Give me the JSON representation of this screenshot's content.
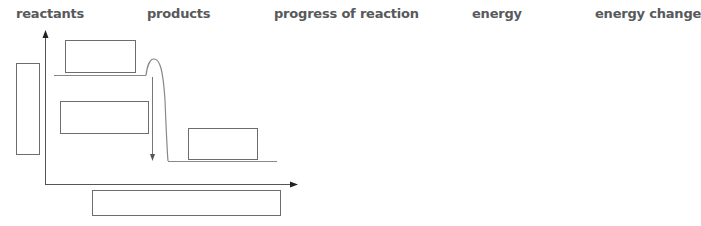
{
  "word_bank": [
    {
      "id": "reactants",
      "label": "reactants",
      "x": 16
    },
    {
      "id": "products",
      "label": "products",
      "x": 147
    },
    {
      "id": "progress-of-reaction",
      "label": "progress of reaction",
      "x": 274
    },
    {
      "id": "energy",
      "label": "energy",
      "x": 472
    },
    {
      "id": "energy-change",
      "label": "energy change",
      "x": 595
    }
  ],
  "diagram": {
    "colors": {
      "line": "#7a7a7a",
      "axis": "#555555",
      "box_border": "#6d6d6d",
      "label_text": "#58595b"
    },
    "boxes": [
      {
        "id": "y-axis-label-box",
        "x": 16,
        "y": 63,
        "w": 23,
        "h": 91,
        "value": ""
      },
      {
        "id": "reactants-box",
        "x": 65,
        "y": 40,
        "w": 70,
        "h": 32,
        "value": ""
      },
      {
        "id": "energy-change-box",
        "x": 60,
        "y": 101,
        "w": 88,
        "h": 32,
        "value": ""
      },
      {
        "id": "products-box",
        "x": 188,
        "y": 128,
        "w": 69,
        "h": 31,
        "value": ""
      },
      {
        "id": "x-axis-label-box",
        "x": 92,
        "y": 190,
        "w": 188,
        "h": 25,
        "value": ""
      }
    ]
  }
}
